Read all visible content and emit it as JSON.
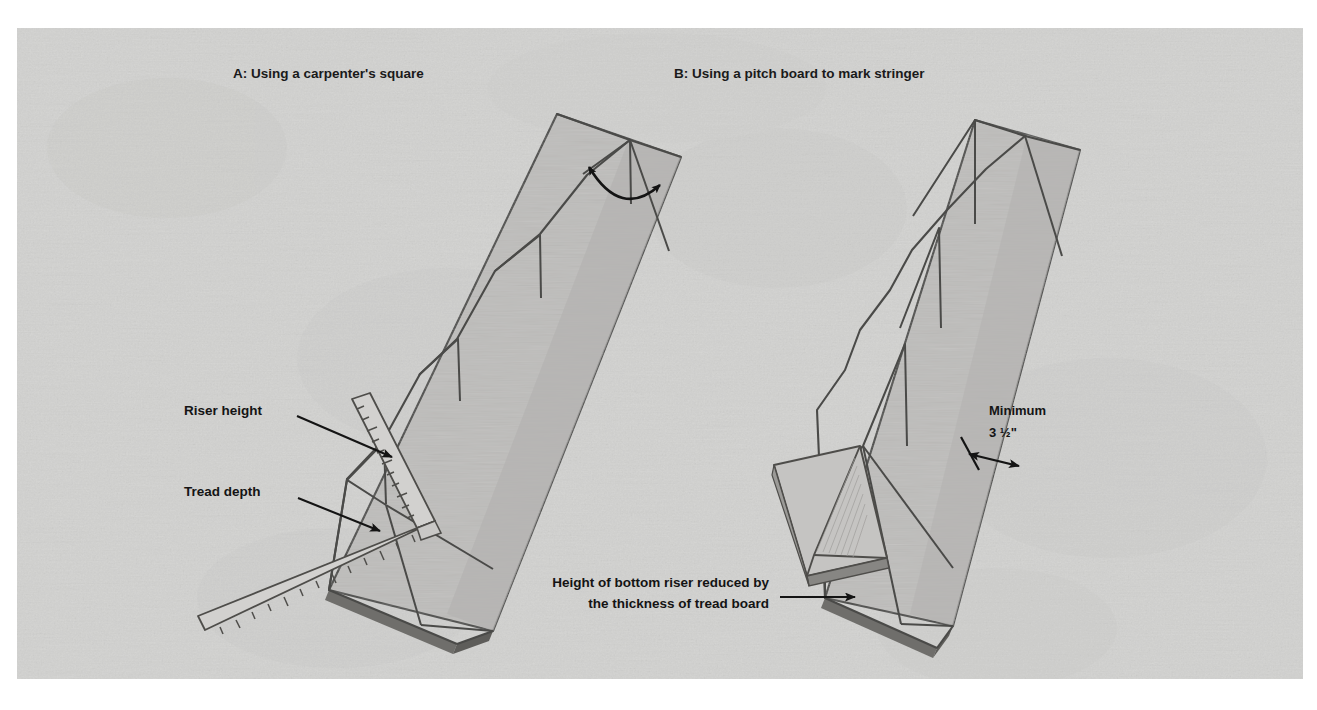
{
  "figure": {
    "background_color": "#d9d9d7",
    "board_fill": "#bdbcba",
    "board_stroke": "#4a4a48",
    "shadow_color": "#7e7d7a",
    "ink_color": "#141414",
    "panel_a": {
      "title": "A: Using a carpenter's square",
      "labels": {
        "riser": "Riser height",
        "tread": "Tread depth"
      },
      "tool_name": "carpenter's square",
      "angle_marker": "square-angle-arc"
    },
    "panel_b": {
      "title": "B: Using a pitch board to mark stringer",
      "dimension": {
        "line1": "Minimum",
        "line2": "3 ½\""
      },
      "caption": {
        "line1": "Height of bottom riser reduced by",
        "line2": "the thickness of tread board"
      },
      "tool_name": "pitch board"
    }
  }
}
